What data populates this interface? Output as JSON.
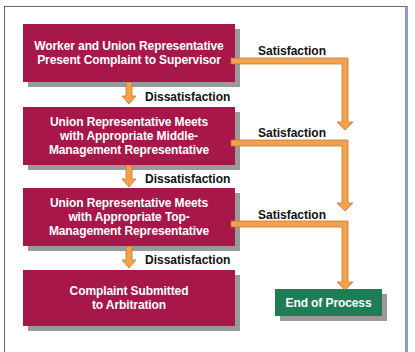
{
  "diagram": {
    "type": "flowchart",
    "colors": {
      "step_box": "#a8174a",
      "end_box": "#1f7d55",
      "connector": "#f2a24e",
      "shadow": "#9a9a9a",
      "frame_accent": "#8e9ad0"
    },
    "steps": [
      {
        "id": "step1",
        "text": "Worker and Union Representative Present Complaint to Supervisor"
      },
      {
        "id": "step2",
        "text": "Union Representative Meets with Appropriate Middle-Management Representative"
      },
      {
        "id": "step3",
        "text": "Union Representative Meets with Appropriate Top-Management Representative"
      },
      {
        "id": "step4",
        "text": "Complaint Submitted to Arbitration"
      }
    ],
    "end": {
      "id": "end",
      "text": "End of Process"
    },
    "edges": [
      {
        "from": "step1",
        "to": "step2",
        "label": "Dissatisfaction"
      },
      {
        "from": "step2",
        "to": "step3",
        "label": "Dissatisfaction"
      },
      {
        "from": "step3",
        "to": "step4",
        "label": "Dissatisfaction"
      },
      {
        "from": "step1",
        "to": "end",
        "label": "Satisfaction"
      },
      {
        "from": "step2",
        "to": "end",
        "label": "Satisfaction"
      },
      {
        "from": "step3",
        "to": "end",
        "label": "Satisfaction"
      }
    ],
    "lines": {
      "step1": [
        "Worker and Union Representative",
        "Present Complaint to Supervisor"
      ],
      "step2": [
        "Union Representative Meets",
        "with Appropriate Middle-",
        "Management Representative"
      ],
      "step3": [
        "Union Representative Meets",
        "with Appropriate Top-",
        "Management Representative"
      ],
      "step4": [
        "Complaint Submitted",
        "to Arbitration"
      ]
    },
    "labels": {
      "satisfaction": "Satisfaction",
      "dissatisfaction": "Dissatisfaction"
    }
  }
}
